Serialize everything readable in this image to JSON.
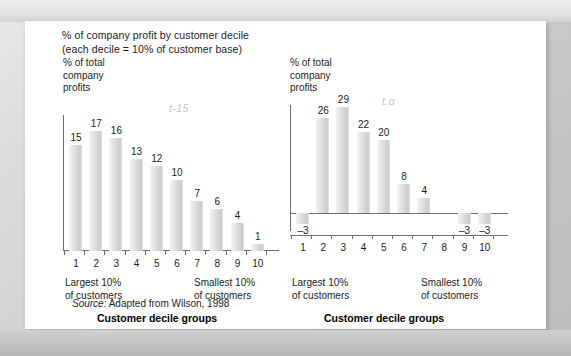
{
  "header": {
    "line1": "% of company profit by customer decile",
    "line2": "(each decile = 10% of customer base)"
  },
  "source": {
    "label": "Source:",
    "text": "Adapted from Wilson, 1998"
  },
  "axis_common": {
    "y_title_l1": "% of total",
    "y_title_l2": "company",
    "y_title_l3": "profits",
    "largest_l1": "Largest 10%",
    "largest_l2": "of customers",
    "smallest_l1": "Smallest 10%",
    "smallest_l2": "of customers",
    "caption": "Customer decile groups"
  },
  "chart_data": [
    {
      "id": "left",
      "type": "bar",
      "title": "",
      "watermark": "t-15",
      "xlabel": "Customer decile groups",
      "ylabel": "% of total company profits",
      "categories": [
        "1",
        "2",
        "3",
        "4",
        "5",
        "6",
        "7",
        "8",
        "9",
        "10"
      ],
      "values": [
        15,
        17,
        16,
        13,
        12,
        10,
        7,
        6,
        4,
        1
      ],
      "ylim": [
        0,
        19
      ],
      "grid": false,
      "legend": "none",
      "annotations": {
        "left_end": "Largest 10% of customers",
        "right_end": "Smallest 10% of customers"
      }
    },
    {
      "id": "right",
      "type": "bar",
      "title": "",
      "watermark": "t.o",
      "xlabel": "Customer decile groups",
      "ylabel": "% of total company profits",
      "categories": [
        "1",
        "2",
        "3",
        "4",
        "5",
        "6",
        "7",
        "8",
        "9",
        "10"
      ],
      "values": [
        -3,
        26,
        29,
        22,
        20,
        8,
        4,
        0,
        -3,
        -3
      ],
      "ylim": [
        -5,
        32
      ],
      "grid": false,
      "legend": "none",
      "annotations": {
        "left_end": "Largest 10% of customers",
        "right_end": "Smallest 10% of customers"
      }
    }
  ]
}
